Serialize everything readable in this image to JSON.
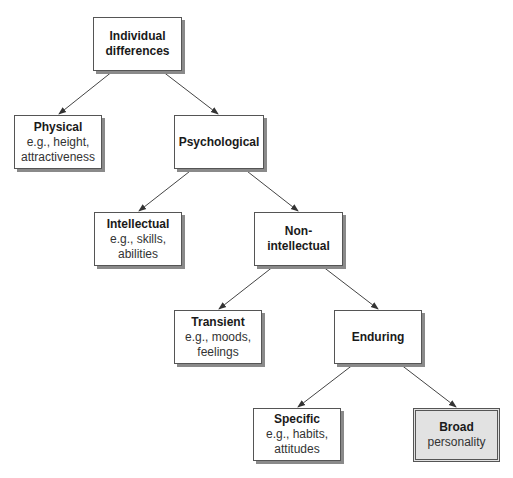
{
  "diagram": {
    "nodes": {
      "root": {
        "title": "Individual",
        "title2": "differences"
      },
      "physical": {
        "title": "Physical",
        "line1": "e.g., height,",
        "line2": "attractiveness"
      },
      "psychological": {
        "title": "Psychological"
      },
      "intellectual": {
        "title": "Intellectual",
        "line1": "e.g., skills,",
        "line2": "abilities"
      },
      "nonintellectual": {
        "title": "Non-intellectual"
      },
      "transient": {
        "title": "Transient",
        "line1": "e.g., moods,",
        "line2": "feelings"
      },
      "enduring": {
        "title": "Enduring"
      },
      "specific": {
        "title": "Specific",
        "line1": "e.g., habits,",
        "line2": "attitudes"
      },
      "broad": {
        "title": "Broad",
        "line1": "personality"
      }
    },
    "edges": [
      [
        "Individual differences",
        "Physical"
      ],
      [
        "Individual differences",
        "Psychological"
      ],
      [
        "Psychological",
        "Intellectual"
      ],
      [
        "Psychological",
        "Non-intellectual"
      ],
      [
        "Non-intellectual",
        "Transient"
      ],
      [
        "Non-intellectual",
        "Enduring"
      ],
      [
        "Enduring",
        "Specific"
      ],
      [
        "Enduring",
        "Broad"
      ]
    ],
    "highlight_color": "#e2e2e2"
  }
}
